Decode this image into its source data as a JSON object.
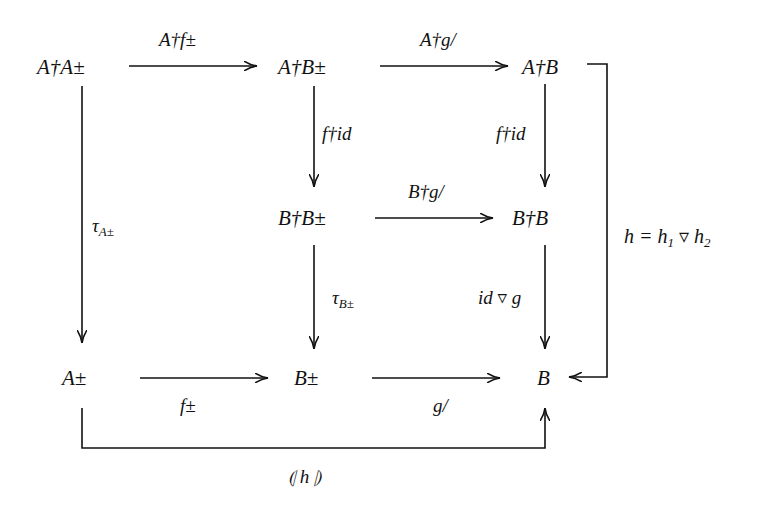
{
  "diagram": {
    "type": "commutative-diagram",
    "nodes": {
      "AdagAbot": "A†A±",
      "AdagBbot": "A†B±",
      "AdagB": "A†B",
      "BdagBbot": "B†B±",
      "BdagB": "B†B",
      "Abot": "A±",
      "Bbot": "B±",
      "B": "B"
    },
    "labels": {
      "A_dag_f_bot": "A†f±",
      "A_dag_g_slash": "A†g/",
      "f_dag_id_left": "f†id",
      "f_dag_id_right": "f†id",
      "B_dag_g_slash": "B†g/",
      "tau_main": "τ",
      "tau_A_sub": "A±",
      "tau_B_sub": "B±",
      "id_nabla_g": "id ▿ g",
      "f_bot": "f±",
      "g_slash": "g/",
      "h_def": "h = h",
      "h_def_sub1": "1",
      "h_def_mid": " ▿ h",
      "h_def_sub2": "2",
      "catamorphism": "⦇ h ⦈"
    },
    "edges": [
      {
        "from": "A†A±",
        "to": "A†B±",
        "label": "A†f±"
      },
      {
        "from": "A†B±",
        "to": "A†B",
        "label": "A†g/"
      },
      {
        "from": "A†B±",
        "to": "B†B±",
        "label": "f†id"
      },
      {
        "from": "A†B",
        "to": "B†B",
        "label": "f†id"
      },
      {
        "from": "B†B±",
        "to": "B†B",
        "label": "B†g/"
      },
      {
        "from": "A†A±",
        "to": "A±",
        "label": "τ_A±"
      },
      {
        "from": "B†B±",
        "to": "B±",
        "label": "τ_B±"
      },
      {
        "from": "B†B",
        "to": "B",
        "label": "id ▿ g"
      },
      {
        "from": "A±",
        "to": "B±",
        "label": "f±"
      },
      {
        "from": "B±",
        "to": "B",
        "label": "g/"
      },
      {
        "from": "A†B",
        "to": "B",
        "label": "h = h1 ▿ h2"
      },
      {
        "from": "A±",
        "to": "B",
        "label": "⦇ h ⦈"
      }
    ]
  }
}
